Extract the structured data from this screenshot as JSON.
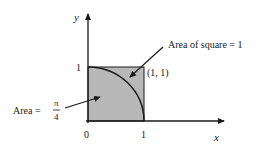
{
  "diagram": {
    "axes": {
      "x_label": "x",
      "y_label": "y",
      "origin_label": "0",
      "x_tick_label": "1",
      "y_tick_label": "1"
    },
    "point_label": "(1, 1)",
    "annotations": {
      "square_area": "Area of square = 1",
      "quarter_area_prefix": "Area =",
      "quarter_area_numerator": "π",
      "quarter_area_denominator": "4"
    },
    "colors": {
      "fill": "#b8b8b8",
      "stroke": "#1a1a1a"
    }
  }
}
